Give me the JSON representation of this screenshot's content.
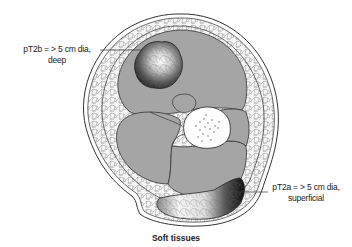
{
  "figure": {
    "caption": "Soft tissues",
    "annotations": [
      {
        "id": "pT2b",
        "line1": "pT2b = > 5 cm dia,",
        "line2": "deep",
        "side": "left",
        "points_to": "deep tumor within muscle compartment"
      },
      {
        "id": "pT2a",
        "line1": "pT2a = > 5 cm dia,",
        "line2": "superficial",
        "side": "right",
        "points_to": "superficial tumor in subcutaneous fat"
      }
    ],
    "structures": [
      "skin",
      "subcutaneous fat",
      "fascia",
      "muscle compartments",
      "bone",
      "bone marrow",
      "deep tumor",
      "superficial tumor"
    ],
    "colors": {
      "muscle": "#a3a3a3",
      "fat": "#f4f4f4",
      "outline": "#333333",
      "bone": "#ffffff",
      "tumor_dark": "#1a1a1a",
      "tumor_light": "#f5f5f5"
    }
  }
}
